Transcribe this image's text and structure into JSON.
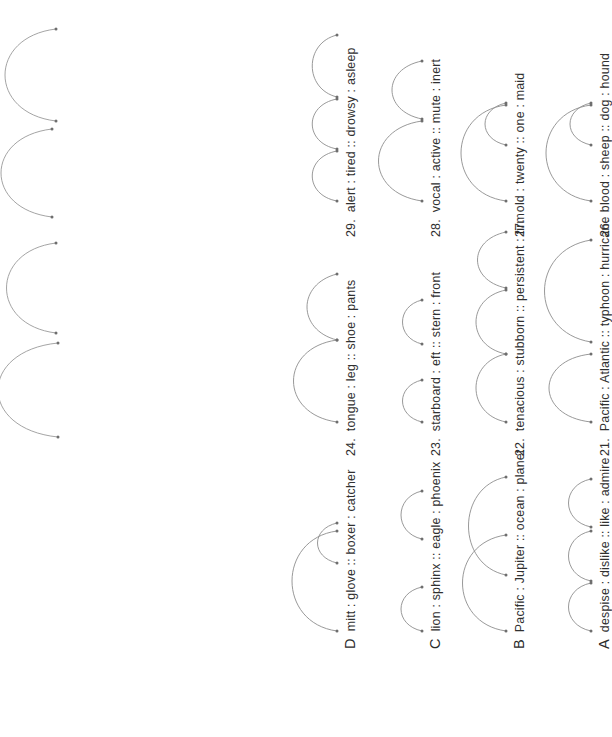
{
  "document": {
    "kind": "verbal-analogy-worksheet",
    "page_background": "#ffffff",
    "ink_color": "#303030",
    "arc_color": "#8d8d8d",
    "rotation_degrees": -90,
    "columns": [
      {
        "column_name": "lettered-examples",
        "items": [
          {
            "label": "A",
            "text": "despise : dislike :: like : admire",
            "arcs": [
              {
                "from_word": "despise",
                "to_word": "dislike"
              },
              {
                "from_word": "dislike",
                "to_word": "like"
              },
              {
                "from_word": "like",
                "to_word": "admire"
              }
            ]
          },
          {
            "label": "B",
            "text": "Pacific : Jupiter :: ocean : planet",
            "arcs": [
              {
                "from_word": "Pacific",
                "to_word": "ocean"
              },
              {
                "from_word": "Jupiter",
                "to_word": "planet"
              }
            ]
          },
          {
            "label": "C",
            "text": "lion : sphinx :: eagle : phoenix",
            "arcs": [
              {
                "from_word": "lion",
                "to_word": "sphinx"
              },
              {
                "from_word": "eagle",
                "to_word": "phoenix"
              }
            ]
          },
          {
            "label": "D",
            "text": "mitt : glove :: boxer : catcher",
            "arcs": [
              {
                "from_word": "mitt",
                "to_word": "boxer"
              },
              {
                "from_word": "glove",
                "to_word": "catcher"
              }
            ]
          }
        ]
      },
      {
        "column_name": "numbered-middle",
        "items": [
          {
            "label": "21.",
            "text": "Pacific : Atlantic :: typhoon : hurricane",
            "arcs": [
              {
                "from_word": "Pacific",
                "to_word": "typhoon"
              },
              {
                "from_word": "Atlantic",
                "to_word": "hurricane"
              }
            ]
          },
          {
            "label": "22.",
            "text": "tenacious : stubborn :: persistent : firm",
            "arcs": [
              {
                "from_word": "tenacious",
                "to_word": "stubborn"
              },
              {
                "from_word": "stubborn",
                "to_word": "persistent"
              },
              {
                "from_word": "persistent",
                "to_word": "firm"
              }
            ]
          },
          {
            "label": "23.",
            "text": "starboard : eft :: stern : front",
            "arcs": [
              {
                "from_word": "starboard",
                "to_word": "eft"
              },
              {
                "from_word": "stern",
                "to_word": "front"
              }
            ]
          },
          {
            "label": "24.",
            "text": "tongue : leg :: shoe : pants",
            "arcs": [
              {
                "from_word": "tongue",
                "to_word": "shoe"
              },
              {
                "from_word": "leg",
                "to_word": "pants"
              }
            ]
          }
        ]
      },
      {
        "column_name": "numbered-right",
        "items": [
          {
            "label": "26.",
            "text": "blood : sheep :: dog : hound",
            "arcs": [
              {
                "from_word": "blood",
                "to_word": "dog"
              },
              {
                "from_word": "sheep",
                "to_word": "hound"
              }
            ]
          },
          {
            "label": "27.",
            "text": "old : twenty :: one : maid",
            "arcs": [
              {
                "from_word": "old",
                "to_word": "one"
              },
              {
                "from_word": "twenty",
                "to_word": "maid"
              }
            ]
          },
          {
            "label": "28.",
            "text": "vocal : active :: mute : inert",
            "arcs": [
              {
                "from_word": "vocal",
                "to_word": "mute"
              },
              {
                "from_word": "active",
                "to_word": "inert"
              }
            ]
          },
          {
            "label": "29.",
            "text": "alert : tired :: drowsy : asleep",
            "arcs": [
              {
                "from_word": "alert",
                "to_word": "tired"
              },
              {
                "from_word": "tired",
                "to_word": "drowsy"
              },
              {
                "from_word": "drowsy",
                "to_word": "asleep"
              }
            ]
          }
        ]
      }
    ],
    "clipped_edge_arcs_note": "large arcs from the next column run off the right edge of the scan"
  }
}
